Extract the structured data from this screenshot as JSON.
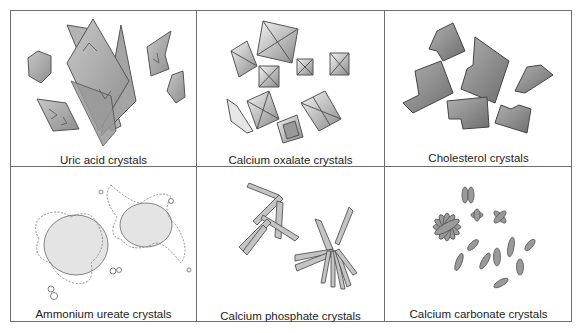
{
  "figure": {
    "panels": [
      {
        "id": "uric-acid",
        "label": "Uric acid crystals"
      },
      {
        "id": "calcium-oxalate",
        "label": "Calcium oxalate crystals"
      },
      {
        "id": "cholesterol",
        "label": "Cholesterol crystals"
      },
      {
        "id": "ammonium-urate",
        "label": "Ammonium ureate crystals"
      },
      {
        "id": "calcium-phosphate",
        "label": "Calcium phosphate crystals"
      },
      {
        "id": "calcium-carbonate",
        "label": "Calcium carbonate crystals"
      }
    ],
    "colors": {
      "border": "#6e6e6e",
      "crystal_fill": "#a8a8a8",
      "crystal_dark": "#7a7a7a",
      "crystal_light": "#d8d8d8"
    }
  }
}
